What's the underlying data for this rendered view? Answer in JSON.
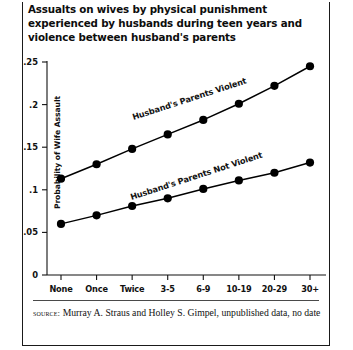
{
  "figure": {
    "title": "Assualts on wives by physical punishment experienced by husbands during teen years and violence between husband's parents",
    "source_kicker": "source:",
    "source_text": " Murray A. Straus and Holley S. Gimpel, unpublished data, no date"
  },
  "chart_data": {
    "type": "line",
    "title": "Assualts on wives by physical punishment experienced by husbands during teen years and violence between husband's parents",
    "xlabel": "",
    "ylabel": "Probability of Wife Assault",
    "categories": [
      "None",
      "Once",
      "Twice",
      "3-5",
      "6-9",
      "10-19",
      "20-29",
      "30+"
    ],
    "ylim": [
      0,
      0.25
    ],
    "yticks": [
      0,
      0.05,
      0.1,
      0.15,
      0.2,
      0.25
    ],
    "ytick_labels": [
      "0",
      ".05",
      ".1",
      ".15",
      ".2",
      ".25"
    ],
    "grid": false,
    "legend_position": "inline-annotation",
    "marker": "filled-circle",
    "series": [
      {
        "name": "Husband's Parents Violent",
        "values": [
          0.113,
          0.13,
          0.148,
          0.165,
          0.182,
          0.201,
          0.222,
          0.245
        ],
        "color": "#000000"
      },
      {
        "name": "Husband's Parents  Not Violent",
        "values": [
          0.06,
          0.07,
          0.081,
          0.09,
          0.101,
          0.111,
          0.12,
          0.132
        ],
        "color": "#000000"
      }
    ],
    "annotations": [
      {
        "text": "Husband's Parents Violent",
        "rotation": -18
      },
      {
        "text": "Husband's Parents  Not Violent",
        "rotation": -18
      }
    ]
  }
}
